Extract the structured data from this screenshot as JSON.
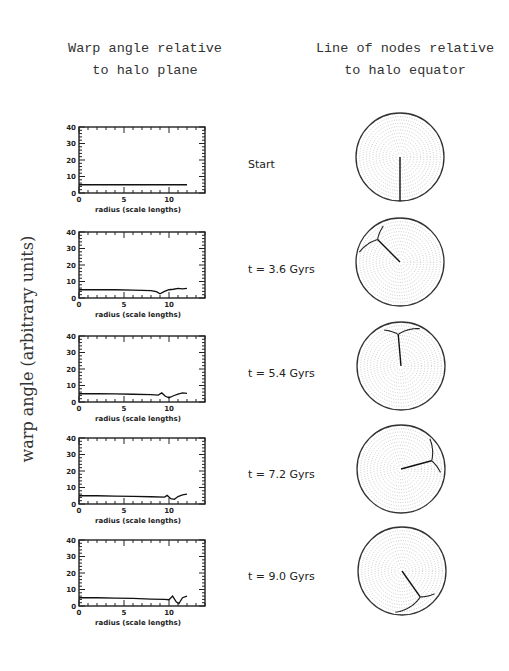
{
  "titles": {
    "left_line1": "Warp angle relative",
    "left_line2": "to halo plane",
    "right_line1": "Line of nodes relative",
    "right_line2": "to halo equator"
  },
  "y_axis_label": "warp angle (arbitrary units)",
  "panels": [
    {
      "time_label": "Start"
    },
    {
      "time_label": "t = 3.6 Gyrs"
    },
    {
      "time_label": "t = 5.4 Gyrs"
    },
    {
      "time_label": "t = 7.2 Gyrs"
    },
    {
      "time_label": "t = 9.0 Gyrs"
    }
  ],
  "chart_data": [
    {
      "type": "line",
      "title": "Start",
      "xlabel": "radius (scale lengths)",
      "ylabel": "warp angle (arbitrary units)",
      "xlim": [
        0,
        14
      ],
      "ylim": [
        0,
        40
      ],
      "xticks": [
        0,
        5,
        10
      ],
      "yticks": [
        0,
        10,
        20,
        30,
        40
      ],
      "x": [
        0,
        2,
        4,
        6,
        8,
        10,
        12
      ],
      "y": [
        5,
        5,
        5,
        5,
        5,
        5,
        5
      ]
    },
    {
      "type": "line",
      "title": "t = 3.6 Gyrs",
      "xlabel": "radius (scale lengths)",
      "xlim": [
        0,
        14
      ],
      "ylim": [
        0,
        40
      ],
      "xticks": [
        0,
        5,
        10
      ],
      "yticks": [
        0,
        10,
        20,
        30,
        40
      ],
      "x": [
        0,
        2,
        4,
        6,
        8,
        8.6,
        9.0,
        9.5,
        10,
        10.5,
        11,
        11.5,
        12
      ],
      "y": [
        5,
        5,
        5,
        4.8,
        4.5,
        3.8,
        2.5,
        4,
        5,
        5.3,
        5.8,
        5.5,
        5.8
      ]
    },
    {
      "type": "line",
      "title": "t = 5.4 Gyrs",
      "xlabel": "radius (scale lengths)",
      "xlim": [
        0,
        14
      ],
      "ylim": [
        0,
        40
      ],
      "xticks": [
        0,
        5,
        10
      ],
      "yticks": [
        0,
        10,
        20,
        30,
        40
      ],
      "x": [
        0,
        2,
        4,
        6,
        8,
        8.8,
        9.2,
        9.6,
        10,
        10.5,
        11,
        11.5,
        12
      ],
      "y": [
        5,
        5,
        4.9,
        4.7,
        4.5,
        4.2,
        5.5,
        3.5,
        2.5,
        3.8,
        4.8,
        5.5,
        5.2
      ]
    },
    {
      "type": "line",
      "title": "t = 7.2 Gyrs",
      "xlabel": "radius (scale lengths)",
      "xlim": [
        0,
        14
      ],
      "ylim": [
        0,
        40
      ],
      "xticks": [
        0,
        5,
        10
      ],
      "yticks": [
        0,
        10,
        20,
        30,
        40
      ],
      "x": [
        0,
        2,
        4,
        6,
        8,
        9.5,
        9.8,
        10.2,
        10.6,
        11,
        11.5,
        12
      ],
      "y": [
        5,
        5,
        4.8,
        4.6,
        4.4,
        4.2,
        5.2,
        3.2,
        2.8,
        4.5,
        5.5,
        6
      ]
    },
    {
      "type": "line",
      "title": "t = 9.0 Gyrs",
      "xlabel": "radius (scale lengths)",
      "xlim": [
        0,
        14
      ],
      "ylim": [
        0,
        40
      ],
      "xticks": [
        0,
        5,
        10
      ],
      "yticks": [
        0,
        10,
        20,
        30,
        40
      ],
      "x": [
        0,
        2,
        4,
        6,
        8,
        9.5,
        10,
        10.4,
        10.8,
        11.1,
        11.5,
        12
      ],
      "y": [
        5,
        5,
        4.8,
        4.6,
        4.2,
        4.0,
        3.8,
        6,
        2.5,
        1.5,
        5,
        6
      ]
    }
  ],
  "polar_nodes": [
    {
      "title": "Start",
      "angle_deg": 270,
      "note": "straight line of nodes from center to bottom edge"
    },
    {
      "title": "t = 3.6 Gyrs",
      "angle_deg": 135,
      "note": "line to upper-left, trailing spiral near edge"
    },
    {
      "title": "t = 5.4 Gyrs",
      "angle_deg": 95,
      "note": "line upward, tangential spread near top edge"
    },
    {
      "title": "t = 7.2 Gyrs",
      "angle_deg": 15,
      "note": "line to right, spread near right edge"
    },
    {
      "title": "t = 9.0 Gyrs",
      "angle_deg": 305,
      "note": "line to lower-right, spiral spread near lower edge"
    }
  ]
}
